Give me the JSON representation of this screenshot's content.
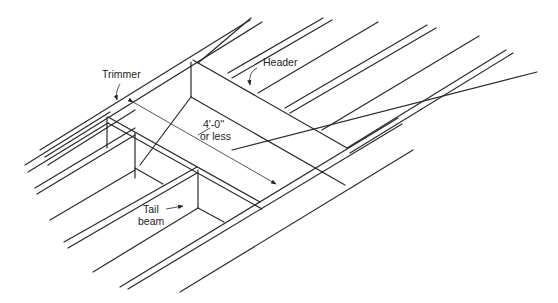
{
  "diagram": {
    "type": "isometric floor framing opening",
    "labels": {
      "trimmer": "Trimmer",
      "header": "Header",
      "dimension_line1": "4'-0''",
      "dimension_line2": "or less",
      "tail_beam_line1": "Tail",
      "tail_beam_line2": "beam"
    },
    "colors": {
      "line": "#2a2a2a",
      "background": "#ffffff"
    }
  }
}
